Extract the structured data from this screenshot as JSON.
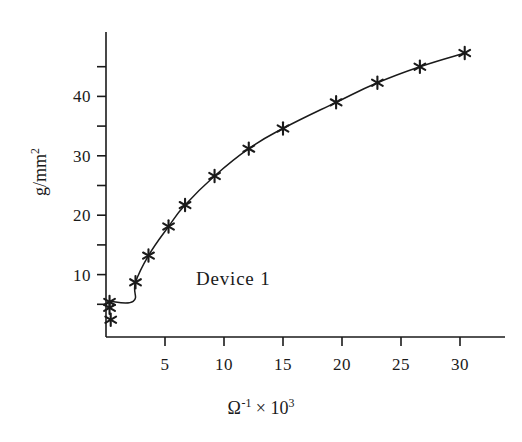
{
  "chart_data": {
    "type": "line",
    "title": "",
    "subtitle": "",
    "xlabel_text": "Ω⁻¹ × 10³",
    "xlabel_symbol": "Ω",
    "xlabel_symbol_sup": "-1",
    "xlabel_times": "×",
    "xlabel_base": "10",
    "xlabel_base_sup": "3",
    "ylabel_text": "g/mm²",
    "ylabel_main": "g/mm",
    "ylabel_sup": "2",
    "annotation": "Device 1",
    "xlim": [
      0,
      33
    ],
    "ylim": [
      0,
      49
    ],
    "grid": false,
    "legend": "none",
    "line_color": "#1a1a1a",
    "marker": "asterisk",
    "marker_color": "#1a1a1a",
    "xticks_major": [
      5,
      10,
      15,
      20,
      25,
      30
    ],
    "xtick_labels": [
      "5",
      "10",
      "15",
      "20",
      "25",
      "30"
    ],
    "yticks_major": [
      10,
      20,
      30,
      40
    ],
    "ytick_labels": [
      "10",
      "20",
      "30",
      "40"
    ],
    "yticks_minor": [
      5,
      15,
      25,
      35,
      45
    ],
    "x": [
      0.3,
      0.3,
      0.4,
      2.5,
      3.6,
      5.3,
      6.7,
      9.2,
      12.1,
      15.0,
      19.5,
      23.0,
      26.6,
      30.4
    ],
    "y": [
      5.4,
      4.4,
      2.4,
      8.7,
      13.2,
      18.1,
      21.7,
      26.6,
      31.2,
      34.6,
      39.0,
      42.3,
      45.0,
      47.3
    ],
    "curve_x": [
      0.3,
      2.3,
      2.5,
      3.6,
      5.3,
      6.7,
      9.2,
      12.1,
      15.0,
      19.5,
      23.0,
      26.6,
      30.4
    ],
    "curve_y": [
      5.5,
      5.5,
      8.7,
      13.2,
      18.1,
      21.7,
      26.6,
      31.2,
      34.6,
      39.0,
      42.3,
      45.0,
      47.3
    ]
  }
}
